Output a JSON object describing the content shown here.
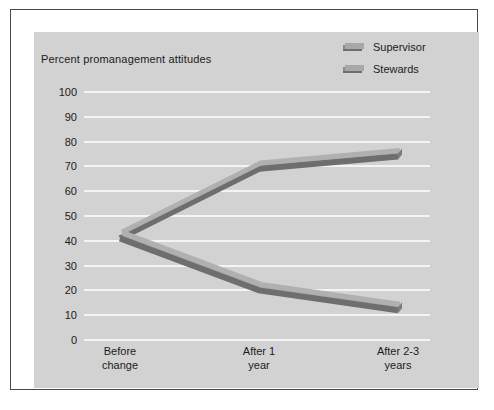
{
  "chart_data": {
    "type": "line",
    "title": "Percent promanagement attitudes",
    "xlabel": "",
    "ylabel": "",
    "ylim": [
      0,
      100
    ],
    "yticks": [
      0,
      10,
      20,
      30,
      40,
      50,
      60,
      70,
      80,
      90,
      100
    ],
    "ytick_labels": [
      "0",
      "10",
      "20",
      "30",
      "40",
      "50",
      "60",
      "70",
      "80",
      "90",
      "100"
    ],
    "categories": [
      "Before change",
      "After 1 year",
      "After 2-3 years"
    ],
    "category_lines": [
      [
        "Before",
        "change"
      ],
      [
        "After 1",
        "year"
      ],
      [
        "After 2-3",
        "years"
      ]
    ],
    "grid": "horizontal",
    "legend_position": "top-right",
    "series": [
      {
        "name": "Supervisor",
        "values": [
          41,
          69,
          74
        ],
        "color": "#9a9a9a",
        "shade_color": "#6e6e6e"
      },
      {
        "name": "Stewards",
        "values": [
          41,
          20,
          12
        ],
        "color": "#9a9a9a",
        "shade_color": "#6e6e6e"
      }
    ]
  },
  "legend": {
    "items": [
      {
        "label": "Supervisor"
      },
      {
        "label": "Stewards"
      }
    ]
  },
  "colors": {
    "background": "#d2d2d2",
    "frame": "#4a4a4a",
    "mat": "#ffffff",
    "gridline": "#f4f4f4",
    "text": "#1b1b1b",
    "ribbon_top": "#a8a8a8",
    "ribbon_front": "#8b8b8b",
    "ribbon_edge": "#6f6f6f"
  }
}
